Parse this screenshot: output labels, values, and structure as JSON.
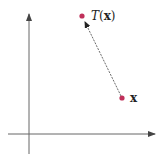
{
  "diagram": {
    "type": "vector transformation in plane",
    "axes": {
      "horizontal": {
        "from": [
          8,
          134
        ],
        "to": [
          155,
          134
        ],
        "arrow": true
      },
      "vertical": {
        "from": [
          29,
          154
        ],
        "to": [
          29,
          14
        ],
        "arrow": true
      },
      "color": "#555555"
    },
    "points": [
      {
        "id": "x",
        "label": "x",
        "position": [
          122,
          98
        ],
        "color": "#c0305a"
      },
      {
        "id": "Tx",
        "label_func": "T",
        "label_arg": "(x)",
        "position": [
          82,
          16
        ],
        "color": "#c0305a"
      }
    ],
    "mapping_arrow": {
      "from": "x",
      "to": "Tx",
      "style": "dashed",
      "color": "#333333"
    }
  },
  "labels": {
    "x_point": "x",
    "tx_func": "T",
    "tx_open": "(",
    "tx_arg": "x",
    "tx_close": ")"
  }
}
